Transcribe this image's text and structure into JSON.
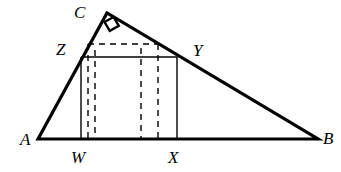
{
  "figure": {
    "kind": "geometry-diagram",
    "background_color": "#ffffff",
    "stroke_color": "#000000",
    "triangle_stroke_width": 3.2,
    "rectangle_stroke_width": 1.4,
    "dashed_stroke_width": 1.4,
    "dash_pattern": "6,5"
  },
  "points": {
    "A": {
      "label": "A",
      "x": 38,
      "y": 139,
      "label_x": 20,
      "label_y": 131
    },
    "B": {
      "label": "B",
      "x": 318,
      "y": 139,
      "label_x": 323,
      "label_y": 130
    },
    "C": {
      "label": "C",
      "x": 107,
      "y": 13,
      "label_x": 74,
      "label_y": 4
    },
    "W": {
      "label": "W",
      "x": 81,
      "y": 139,
      "label_x": 71,
      "label_y": 149
    },
    "X": {
      "label": "X",
      "x": 177,
      "y": 139,
      "label_x": 168,
      "label_y": 149
    },
    "Y": {
      "label": "Y",
      "x": 177,
      "y": 57,
      "label_x": 193,
      "label_y": 42
    },
    "Z": {
      "label": "Z",
      "x": 81,
      "y": 57,
      "label_x": 56,
      "label_y": 41
    }
  },
  "triangle": {
    "name": "triangle-ABC",
    "vertices": [
      "A",
      "C",
      "B"
    ],
    "path": "M 38 139 L 107 13 L 318 139 Z",
    "right_angle_at": "C"
  },
  "right_angle_marker": {
    "name": "right-angle-marker-at-C",
    "path": "M 104.5 22.0 L 113.5 17.0 L 118.8 25.8 L 109.8 30.8 Z"
  },
  "solid_rectangle": {
    "name": "rectangle-WXYZ",
    "corners": [
      "W",
      "X",
      "Y",
      "Z"
    ],
    "left": 81,
    "right": 177,
    "top": 57,
    "bottom": 139,
    "segments": [
      {
        "name": "segment-ZW",
        "d": "M 81 57 L 81 139"
      },
      {
        "name": "segment-ZY",
        "d": "M 81 57 L 177 57"
      },
      {
        "name": "segment-YX",
        "d": "M 177 57 L 177 139"
      }
    ]
  },
  "dashed_rectangle": {
    "name": "dashed-rectangle-inner",
    "left": 88,
    "right": 158,
    "top": 44,
    "bottom": 139,
    "segments": [
      {
        "name": "dashed-top-edge",
        "d": "M 88 44 L 158 44"
      },
      {
        "name": "dashed-left-edge",
        "d": "M 88 44 L 88 139"
      },
      {
        "name": "dashed-right-edge",
        "d": "M 158 44 L 158 139"
      }
    ]
  },
  "dashed_extra_verticals": [
    {
      "name": "dashed-vertical-second",
      "d": "M 95 50 L 95 139"
    },
    {
      "name": "dashed-vertical-third",
      "d": "M 141 48 L 141 139"
    }
  ]
}
